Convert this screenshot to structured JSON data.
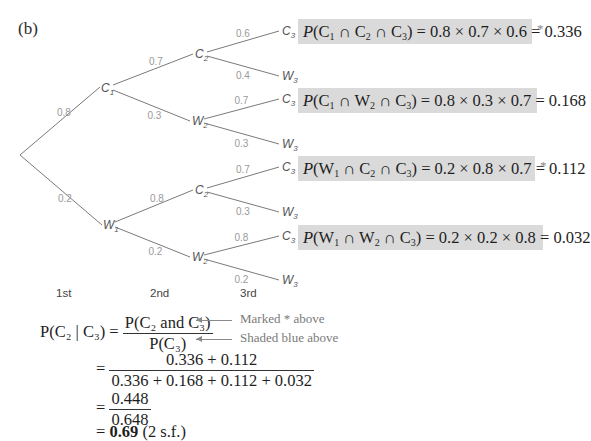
{
  "part_label": "(b)",
  "tree": {
    "root": {
      "x": 20,
      "y": 155
    },
    "level1": [
      {
        "label": "C",
        "sub": "1",
        "prob": "0.8",
        "x": 104,
        "y": 88
      },
      {
        "label": "W",
        "sub": "1",
        "prob": "0.2",
        "x": 106,
        "y": 225
      }
    ],
    "level2": [
      {
        "parent": 0,
        "label": "C",
        "sub": "2",
        "prob": "0.7",
        "x": 198,
        "y": 54
      },
      {
        "parent": 0,
        "label": "W",
        "sub": "2",
        "prob": "0.3",
        "x": 195,
        "y": 121
      },
      {
        "parent": 1,
        "label": "C",
        "sub": "2",
        "prob": "0.8",
        "x": 198,
        "y": 190
      },
      {
        "parent": 1,
        "label": "W",
        "sub": "2",
        "prob": "0.2",
        "x": 195,
        "y": 257
      }
    ],
    "level3": [
      {
        "parent": 0,
        "label": "C",
        "sub": "3",
        "prob": "0.6",
        "x": 282,
        "y": 31
      },
      {
        "parent": 0,
        "label": "W",
        "sub": "3",
        "prob": "0.4",
        "x": 282,
        "y": 76
      },
      {
        "parent": 1,
        "label": "C",
        "sub": "3",
        "prob": "0.7",
        "x": 282,
        "y": 99
      },
      {
        "parent": 1,
        "label": "W",
        "sub": "3",
        "prob": "0.3",
        "x": 282,
        "y": 144
      },
      {
        "parent": 2,
        "label": "C",
        "sub": "3",
        "prob": "0.7",
        "x": 282,
        "y": 167
      },
      {
        "parent": 2,
        "label": "W",
        "sub": "3",
        "prob": "0.3",
        "x": 282,
        "y": 212
      },
      {
        "parent": 3,
        "label": "C",
        "sub": "3",
        "prob": "0.8",
        "x": 282,
        "y": 236
      },
      {
        "parent": 3,
        "label": "W",
        "sub": "3",
        "prob": "0.2",
        "x": 282,
        "y": 280
      }
    ],
    "stages": [
      "1st",
      "2nd",
      "3rd"
    ]
  },
  "calculations": [
    {
      "a": "C",
      "a_sub": "1",
      "b": "C",
      "b_sub": "2",
      "c": "C",
      "c_sub": "3",
      "expr": " = 0.8 × 0.7 × 0.6 = 0.336",
      "marked": "*"
    },
    {
      "a": "C",
      "a_sub": "1",
      "b": "W",
      "b_sub": "2",
      "c": "C",
      "c_sub": "3",
      "expr": " = 0.8 × 0.3 × 0.7 = 0.168",
      "marked": ""
    },
    {
      "a": "W",
      "a_sub": "1",
      "b": "C",
      "b_sub": "2",
      "c": "C",
      "c_sub": "3",
      "expr": " = 0.2 × 0.8 × 0.7 = 0.112",
      "marked": "*"
    },
    {
      "a": "W",
      "a_sub": "1",
      "b": "W",
      "b_sub": "2",
      "c": "C",
      "c_sub": "3",
      "expr": " = 0.2 × 0.2 × 0.8 = 0.032",
      "marked": ""
    }
  ],
  "conditional": {
    "lhs_num": "P(C₂ and C₃)",
    "lhs_den": "P(C₃)",
    "lhs": "P(C₂ | C₃) =",
    "note_num": "Marked * above",
    "note_den": "Shaded blue above",
    "step2_num": "0.336 + 0.112",
    "step2_den": "0.336 + 0.168 + 0.112 + 0.032",
    "step3_num": "0.448",
    "step3_den": "0.648",
    "result_value": "0.69",
    "result_note": "(2 s.f.)",
    "eq": "="
  }
}
